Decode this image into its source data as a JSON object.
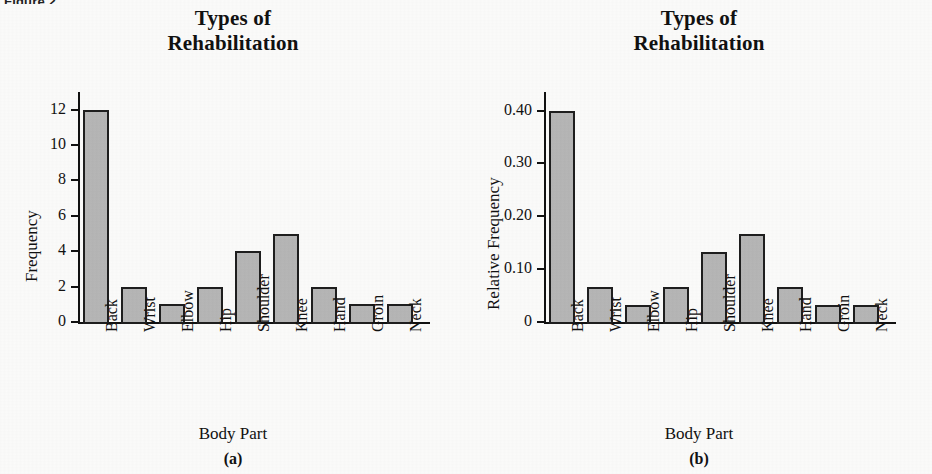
{
  "figure": {
    "label": "Figure 2"
  },
  "panels": [
    {
      "caption": "(a)",
      "title_line1": "Types of",
      "title_line2": "Rehabilitation",
      "xlabel": "Body Part",
      "ylabel": "Frequency",
      "ytick_labels": [
        "12",
        "10",
        "8",
        "6",
        "4",
        "2",
        "0"
      ]
    },
    {
      "caption": "(b)",
      "title_line1": "Types of",
      "title_line2": "Rehabilitation",
      "xlabel": "Body Part",
      "ylabel": "Relative Frequency",
      "ytick_labels": [
        "0.40",
        "0.30",
        "0.20",
        "0.10",
        "0"
      ]
    }
  ],
  "colors": {
    "bar_fill": "#b6b6b6",
    "bar_stroke": "#1e1e1e",
    "axis": "#111111",
    "background": "#fbfbfa"
  },
  "chart_data": [
    {
      "type": "bar",
      "panel": "(a)",
      "title": "Types of Rehabilitation",
      "xlabel": "Body Part",
      "ylabel": "Frequency",
      "categories": [
        "Back",
        "Wrist",
        "Elbow",
        "Hip",
        "Shoulder",
        "Knee",
        "Hand",
        "Groin",
        "Neck"
      ],
      "values": [
        12,
        2,
        1,
        2,
        4,
        5,
        2,
        1,
        1
      ],
      "yticks": [
        0,
        2,
        4,
        6,
        8,
        10,
        12
      ],
      "ylim": [
        0,
        13
      ],
      "grid": false,
      "legend": null
    },
    {
      "type": "bar",
      "panel": "(b)",
      "title": "Types of Rehabilitation",
      "xlabel": "Body Part",
      "ylabel": "Relative Frequency",
      "categories": [
        "Back",
        "Wrist",
        "Elbow",
        "Hip",
        "Shoulder",
        "Knee",
        "Hand",
        "Groin",
        "Neck"
      ],
      "values": [
        0.4,
        0.067,
        0.033,
        0.067,
        0.133,
        0.167,
        0.067,
        0.033,
        0.033
      ],
      "yticks": [
        0,
        0.1,
        0.2,
        0.3,
        0.4
      ],
      "ylim": [
        0,
        0.435
      ],
      "grid": false,
      "legend": null
    }
  ]
}
